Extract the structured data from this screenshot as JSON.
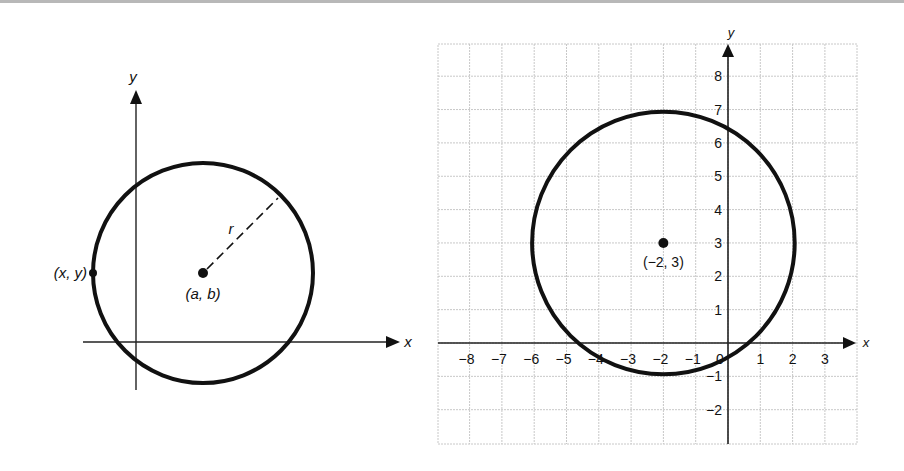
{
  "left_diagram": {
    "x_axis_label": "x",
    "y_axis_label": "y",
    "center_label": "(a, b)",
    "point_label": "(x, y)",
    "radius_label": "r"
  },
  "right_diagram": {
    "x_axis_label": "x",
    "y_axis_label": "y",
    "center_label": "(−2, 3)",
    "origin_label": "0",
    "x_ticks": [
      "−8",
      "−7",
      "−6",
      "−5",
      "−4",
      "−3",
      "−2",
      "−1",
      "1",
      "2",
      "3"
    ],
    "y_ticks": [
      "8",
      "7",
      "6",
      "5",
      "4",
      "3",
      "2",
      "1",
      "−1",
      "−2"
    ],
    "circle": {
      "center_x": -2,
      "center_y": 3,
      "radius": 4
    }
  },
  "colors": {
    "stroke": "#111111",
    "grid": "#c8c8c8",
    "top_bar": "#b8b8b8"
  }
}
